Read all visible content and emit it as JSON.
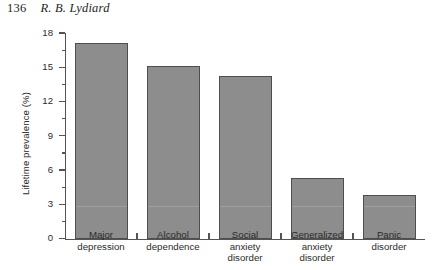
{
  "running_head": {
    "folio": "136",
    "author": "R. B. Lydiard"
  },
  "chart_data": {
    "type": "bar",
    "title": "",
    "xlabel": "",
    "ylabel": "Lifetime prevalence (%)",
    "ylim": [
      0,
      18
    ],
    "yticks": [
      0,
      3,
      6,
      9,
      12,
      15,
      18
    ],
    "ytick_labels": [
      "0",
      "3",
      "6",
      "9",
      "12",
      "15",
      "18"
    ],
    "minor_ticks": [
      1.5,
      4.5,
      7.5,
      10.5,
      13.5,
      16.5
    ],
    "grid": false,
    "legend": null,
    "bar_color": "#8d8d8d",
    "bar_edge_color": "#4e4e4e",
    "axis_color": "#545454",
    "categories": [
      "Major depression",
      "Alcohol dependence",
      "Social anxiety disorder",
      "Generalized anxiety disorder",
      "Panic disorder"
    ],
    "category_lines": [
      [
        "Major",
        "depression"
      ],
      [
        "Alcohol",
        "dependence"
      ],
      [
        "Social",
        "anxiety",
        "disorder"
      ],
      [
        "Generalized",
        "anxiety",
        "disorder"
      ],
      [
        "Panic",
        "disorder"
      ]
    ],
    "values": [
      17.1,
      15.1,
      14.2,
      5.3,
      3.8
    ]
  }
}
